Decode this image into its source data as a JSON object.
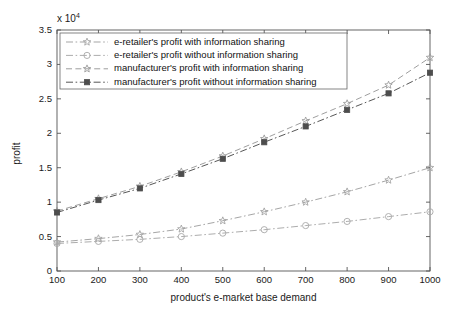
{
  "chart_data": {
    "type": "line",
    "title": "",
    "xlabel": "product's e-market base demand",
    "ylabel": "profit",
    "y_exponent_label": "x 10",
    "y_exponent_value": "4",
    "xlim": [
      100,
      1000
    ],
    "ylim": [
      0,
      35000
    ],
    "x_ticks": [
      "100",
      "200",
      "300",
      "400",
      "500",
      "600",
      "700",
      "800",
      "900",
      "1000"
    ],
    "y_ticks": [
      "0",
      "0.5",
      "1",
      "1.5",
      "2",
      "2.5",
      "3",
      "3.5"
    ],
    "x": [
      100,
      200,
      300,
      400,
      500,
      600,
      700,
      800,
      900,
      1000
    ],
    "grid": false,
    "legend_position": "upper left",
    "series": [
      {
        "name": "e-retailer's profit with information sharing",
        "marker": "star",
        "linestyle": "dashdot",
        "color": "#a0a0a0",
        "values": [
          4200,
          4700,
          5300,
          6100,
          7300,
          8600,
          10000,
          11500,
          13200,
          15000
        ]
      },
      {
        "name": "e-retailer's profit without information sharing",
        "marker": "circle",
        "linestyle": "dashdot",
        "color": "#a8a8a8",
        "values": [
          4000,
          4300,
          4600,
          5000,
          5500,
          6000,
          6600,
          7200,
          7900,
          8600
        ]
      },
      {
        "name": "manufacturer's profit with information sharing",
        "marker": "star",
        "linestyle": "dashed",
        "color": "#999999",
        "values": [
          8700,
          10500,
          12300,
          14400,
          16700,
          19200,
          21800,
          24300,
          27000,
          31000
        ]
      },
      {
        "name": "manufacturer's profit without information sharing",
        "marker": "square-filled",
        "linestyle": "dashdot",
        "color": "#4d4d4d",
        "values": [
          8500,
          10300,
          12000,
          14100,
          16300,
          18700,
          21000,
          23400,
          25800,
          28800
        ]
      }
    ]
  },
  "legend": {
    "items": [
      {
        "label": "e-retailer's profit with information sharing"
      },
      {
        "label": "e-retailer's profit without information sharing"
      },
      {
        "label": "manufacturer's profit with information sharing"
      },
      {
        "label": "manufacturer's profit without information sharing"
      }
    ]
  }
}
